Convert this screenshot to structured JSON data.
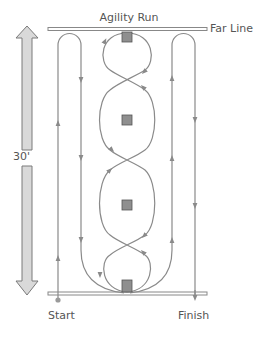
{
  "title": "Agility Run",
  "labels": {
    "far_line": "Far Line",
    "distance": "30'",
    "start": "Start",
    "finish": "Finish"
  },
  "colors": {
    "path": "#8a8a8a",
    "cone_fill": "#8f8f8f",
    "cone_stroke": "#555555",
    "arrow_fill": "#d9d9d9",
    "arrow_stroke": "#7a7a7a",
    "line": "#888888",
    "text": "#555555"
  },
  "cones": [
    {
      "name": "cone-1",
      "x": 127,
      "y": 38
    },
    {
      "name": "cone-2",
      "x": 127,
      "y": 120
    },
    {
      "name": "cone-3",
      "x": 127,
      "y": 205
    },
    {
      "name": "cone-4",
      "x": 127,
      "y": 286
    }
  ]
}
